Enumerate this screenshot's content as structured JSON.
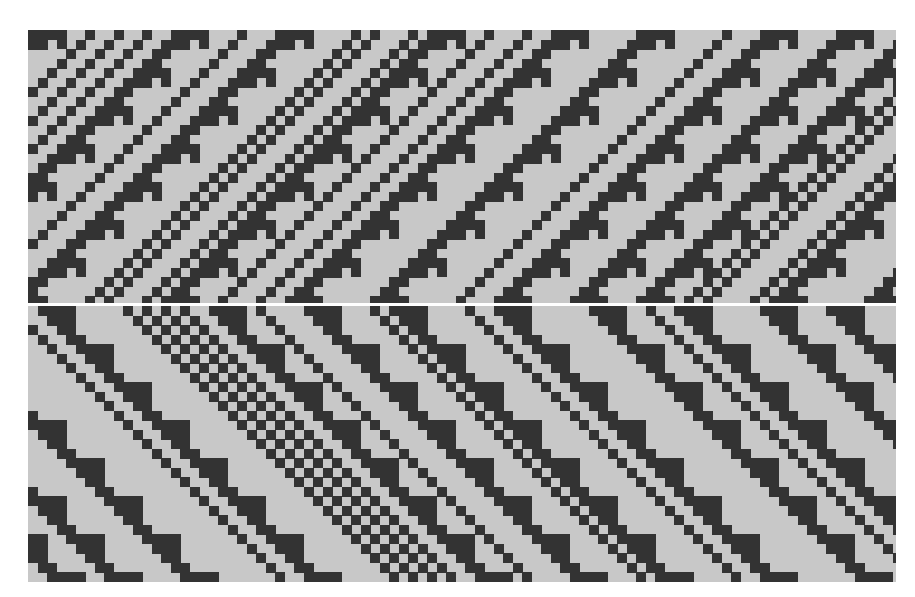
{
  "figure": {
    "panels": [
      {
        "id": "top",
        "orientation": "rising"
      },
      {
        "id": "bottom",
        "orientation": "falling"
      }
    ],
    "cell_size_px": 9.5,
    "colors": {
      "background": "#c8c8c8",
      "cell_on": "#333333",
      "separator": "#ffffff"
    }
  }
}
